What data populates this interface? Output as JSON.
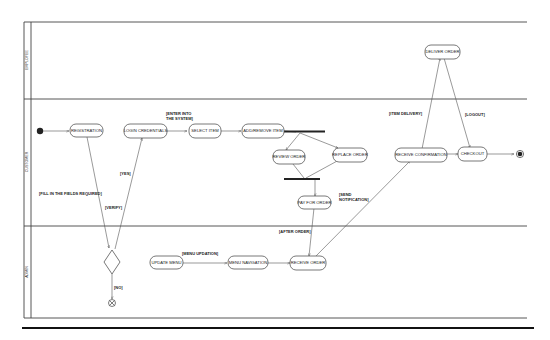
{
  "diagram": {
    "type": "uml-activity-diagram",
    "swimlanes": [
      {
        "id": "employee",
        "label": "EMPLOYEE"
      },
      {
        "id": "customer",
        "label": "CUSTOMER"
      },
      {
        "id": "admin",
        "label": "ADMIN"
      }
    ],
    "nodes": {
      "registration": "REGISTRATION",
      "login_credentials": "LOGIN CREDENTIALS",
      "select_item": "SELECT ITEM",
      "add_remove_item": "ADD/REMOVE ITEM",
      "review_order": "REVIEW ORDER",
      "replace_order": "REPLACE ORDER",
      "pay_for_order": "PAY FOR ORDER",
      "receive_confirmation": "RECEIVE CONFIRMATION",
      "checkout": "CHECKOUT",
      "deliver_order": "DELIVER ORDER",
      "update_menu": "UPDATE MENU",
      "menu_navigation": "MENU NAVIGATION",
      "receive_order": "RECEIVE ORDER"
    },
    "guards": {
      "enter_system_1": "[ENTER INTO",
      "enter_system_2": "THE SYSTEM]",
      "fill_fields": "[FILL IN THE FIELDS REQUIRED]",
      "verify": "[VERIFY]",
      "yes": "[YES]",
      "no": "[NO]",
      "send_notification_1": "[SEND",
      "send_notification_2": "NOTIFICATION]",
      "after_order": "[AFTER ORDER]",
      "item_delivery": "[ITEM DELIVERY]",
      "logout": "[LOGOUT]",
      "menu_updation": "[MENU UPDATION]"
    },
    "colors": {
      "line": "#555555",
      "frame": "#444444",
      "start": "#222222",
      "background": "#ffffff"
    }
  }
}
